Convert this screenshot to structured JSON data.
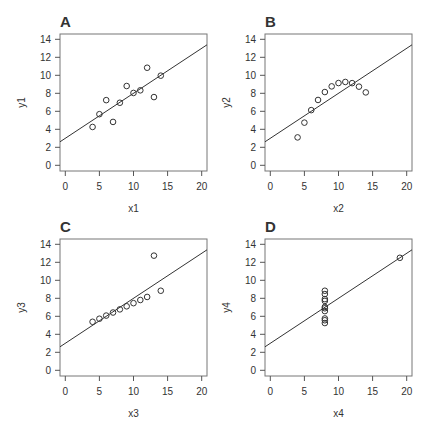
{
  "chart_data": [
    {
      "type": "scatter",
      "panel_label": "A",
      "xlabel": "x1",
      "ylabel": "y1",
      "xlim": [
        0,
        20
      ],
      "ylim": [
        0,
        14
      ],
      "xticks": [
        0,
        5,
        10,
        15,
        20
      ],
      "yticks": [
        0,
        2,
        4,
        6,
        8,
        10,
        12,
        14
      ],
      "x": [
        10,
        8,
        13,
        9,
        11,
        14,
        6,
        4,
        12,
        7,
        5
      ],
      "y": [
        8.04,
        6.95,
        7.58,
        8.81,
        8.33,
        9.96,
        7.24,
        4.26,
        10.84,
        4.82,
        5.68
      ],
      "fit_line": {
        "intercept": 3.0,
        "slope": 0.5
      }
    },
    {
      "type": "scatter",
      "panel_label": "B",
      "xlabel": "x2",
      "ylabel": "y2",
      "xlim": [
        0,
        20
      ],
      "ylim": [
        0,
        14
      ],
      "xticks": [
        0,
        5,
        10,
        15,
        20
      ],
      "yticks": [
        0,
        2,
        4,
        6,
        8,
        10,
        12,
        14
      ],
      "x": [
        10,
        8,
        13,
        9,
        11,
        14,
        6,
        4,
        12,
        7,
        5
      ],
      "y": [
        9.14,
        8.14,
        8.74,
        8.77,
        9.26,
        8.1,
        6.13,
        3.1,
        9.13,
        7.26,
        4.74
      ],
      "fit_line": {
        "intercept": 3.0,
        "slope": 0.5
      }
    },
    {
      "type": "scatter",
      "panel_label": "C",
      "xlabel": "x3",
      "ylabel": "y3",
      "xlim": [
        0,
        20
      ],
      "ylim": [
        0,
        14
      ],
      "xticks": [
        0,
        5,
        10,
        15,
        20
      ],
      "yticks": [
        0,
        2,
        4,
        6,
        8,
        10,
        12,
        14
      ],
      "x": [
        10,
        8,
        13,
        9,
        11,
        14,
        6,
        4,
        12,
        7,
        5
      ],
      "y": [
        7.46,
        6.77,
        12.74,
        7.11,
        7.81,
        8.84,
        6.08,
        5.39,
        8.15,
        6.42,
        5.73
      ],
      "fit_line": {
        "intercept": 3.0,
        "slope": 0.5
      }
    },
    {
      "type": "scatter",
      "panel_label": "D",
      "xlabel": "x4",
      "ylabel": "y4",
      "xlim": [
        0,
        20
      ],
      "ylim": [
        0,
        14
      ],
      "xticks": [
        0,
        5,
        10,
        15,
        20
      ],
      "yticks": [
        0,
        2,
        4,
        6,
        8,
        10,
        12,
        14
      ],
      "x": [
        8,
        8,
        8,
        8,
        8,
        8,
        8,
        19,
        8,
        8,
        8
      ],
      "y": [
        6.58,
        5.76,
        7.71,
        8.84,
        8.47,
        7.04,
        5.25,
        12.5,
        5.56,
        7.91,
        6.89
      ],
      "fit_line": {
        "intercept": 3.0,
        "slope": 0.5
      }
    }
  ]
}
